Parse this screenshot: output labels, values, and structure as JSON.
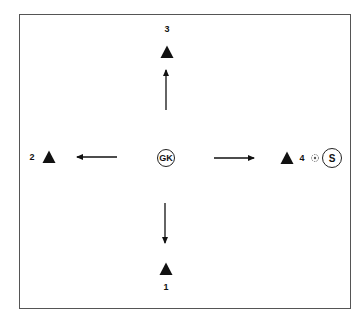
{
  "diagram": {
    "type": "soccer-drill",
    "colors": {
      "border": "#555555",
      "ink": "#111111",
      "background": "#ffffff"
    },
    "center_player": {
      "label": "GK",
      "x": 166,
      "y": 158
    },
    "cones": [
      {
        "label": "1",
        "x": 166,
        "y": 269,
        "label_x": 166,
        "label_y": 287
      },
      {
        "label": "2",
        "x": 49,
        "y": 157,
        "label_x": 32,
        "label_y": 157
      },
      {
        "label": "3",
        "x": 167,
        "y": 52,
        "label_x": 167,
        "label_y": 29
      },
      {
        "label": "4",
        "x": 287,
        "y": 158,
        "label_x": 302,
        "label_y": 158
      }
    ],
    "server": {
      "label": "S",
      "x": 332,
      "y": 158
    },
    "ball": {
      "x": 315,
      "y": 158
    },
    "arrows": [
      {
        "to": "3",
        "x1": 166,
        "y1": 110,
        "x2": 166,
        "y2": 70
      },
      {
        "to": "1",
        "x1": 165,
        "y1": 203,
        "x2": 165,
        "y2": 243
      },
      {
        "to": "2",
        "x1": 117,
        "y1": 157,
        "x2": 77,
        "y2": 157
      },
      {
        "to": "4",
        "x1": 214,
        "y1": 158,
        "x2": 254,
        "y2": 158
      }
    ]
  }
}
